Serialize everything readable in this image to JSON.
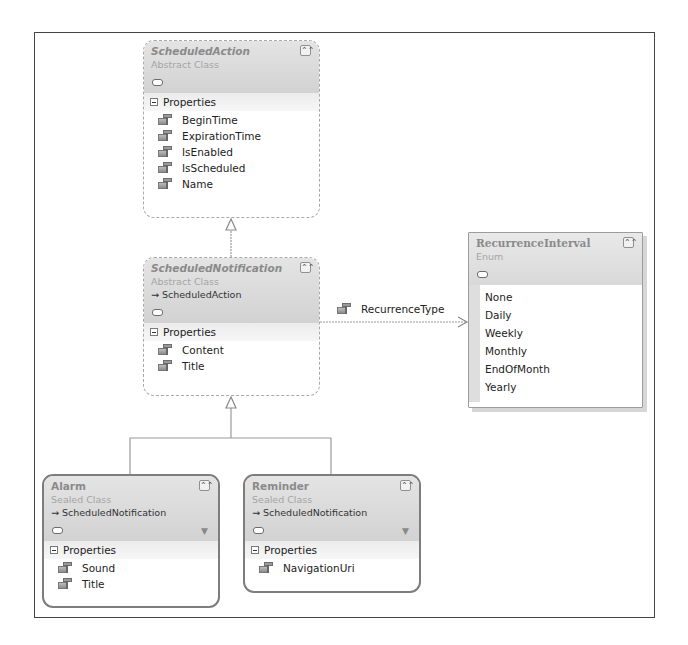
{
  "diagram": {
    "type": "Class Diagram",
    "classes": [
      {
        "name": "ScheduledAction",
        "stereotype": "Abstract Class",
        "base": "",
        "section_label": "Properties",
        "properties": [
          "BeginTime",
          "ExpirationTime",
          "IsEnabled",
          "IsScheduled",
          "Name"
        ]
      },
      {
        "name": "ScheduledNotification",
        "stereotype": "Abstract Class",
        "base": "→ ScheduledAction",
        "section_label": "Properties",
        "properties": [
          "Content",
          "Title"
        ]
      },
      {
        "name": "Alarm",
        "stereotype": "Sealed Class",
        "base": "→ ScheduledNotification",
        "section_label": "Properties",
        "properties": [
          "Sound",
          "Title"
        ]
      },
      {
        "name": "Reminder",
        "stereotype": "Sealed Class",
        "base": "→ ScheduledNotification",
        "section_label": "Properties",
        "properties": [
          "NavigationUri"
        ]
      }
    ],
    "enums": [
      {
        "name": "RecurrenceInterval",
        "stereotype": "Enum",
        "values": [
          "None",
          "Daily",
          "Weekly",
          "Monthly",
          "EndOfMonth",
          "Yearly"
        ]
      }
    ],
    "associations": [
      {
        "from": "ScheduledNotification",
        "to": "RecurrenceInterval",
        "label": "RecurrenceType"
      }
    ],
    "inheritance": [
      {
        "child": "ScheduledNotification",
        "parent": "ScheduledAction"
      },
      {
        "child": "Alarm",
        "parent": "ScheduledNotification"
      },
      {
        "child": "Reminder",
        "parent": "ScheduledNotification"
      }
    ],
    "icons": {
      "collapse": "⌃⌃",
      "filter": "▼"
    },
    "colors": {
      "header_bg": "#d9d9d9",
      "title_text": "#8a8a8a",
      "border": "#a9a9a9",
      "connector": "#9a9a9a"
    }
  }
}
